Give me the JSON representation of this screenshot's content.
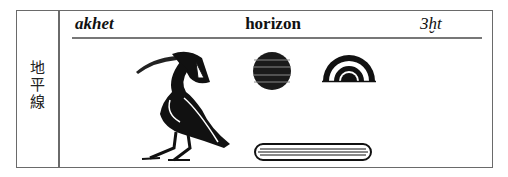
{
  "entry": {
    "side_label": [
      "地",
      "平",
      "線"
    ],
    "transliteration": "akhet",
    "meaning": "horizon",
    "egyptological": "3ḫt"
  },
  "glyphs": [
    {
      "name": "ibis-hieroglyph"
    },
    {
      "name": "sun-disk-hieroglyph"
    },
    {
      "name": "rising-sun-arc-hieroglyph"
    },
    {
      "name": "horizontal-bar-hieroglyph"
    }
  ]
}
